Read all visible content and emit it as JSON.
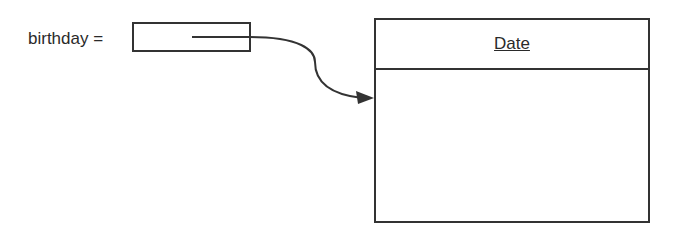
{
  "variable": {
    "name_label": "birthday ="
  },
  "object": {
    "class_name": "Date"
  },
  "reference_arrow": {
    "from": "birthday-variable-box",
    "to": "date-object"
  }
}
